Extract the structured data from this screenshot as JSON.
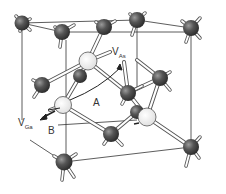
{
  "diagram": {
    "labels": {
      "v_as_main": "V",
      "v_as_sub": "As",
      "v_ga_main": "V",
      "v_ga_sub": "Ga",
      "path_a": "A",
      "path_b": "B"
    },
    "colors": {
      "atom_dark": "#4a4a4a",
      "atom_vacancy": "#f4f4f4",
      "bond": "#555555",
      "cube_edge": "#333333"
    },
    "atoms": [
      {
        "x": 22,
        "y": 23,
        "type": "dark"
      },
      {
        "x": 62,
        "y": 32,
        "type": "dark"
      },
      {
        "x": 104,
        "y": 27,
        "type": "dark"
      },
      {
        "x": 137,
        "y": 20,
        "type": "dark"
      },
      {
        "x": 191,
        "y": 28,
        "type": "dark"
      },
      {
        "x": 42,
        "y": 85,
        "type": "dark"
      },
      {
        "x": 80,
        "y": 76,
        "type": "dark"
      },
      {
        "x": 128,
        "y": 93,
        "type": "dark"
      },
      {
        "x": 160,
        "y": 78,
        "type": "dark"
      },
      {
        "x": 137,
        "y": 112,
        "type": "dark"
      },
      {
        "x": 111,
        "y": 134,
        "type": "dark"
      },
      {
        "x": 191,
        "y": 147,
        "type": "dark"
      },
      {
        "x": 64,
        "y": 162,
        "type": "dark"
      },
      {
        "x": 88,
        "y": 61,
        "type": "vacancy"
      },
      {
        "x": 63,
        "y": 105,
        "type": "vacancy"
      },
      {
        "x": 147,
        "y": 117,
        "type": "vacancy"
      }
    ]
  }
}
